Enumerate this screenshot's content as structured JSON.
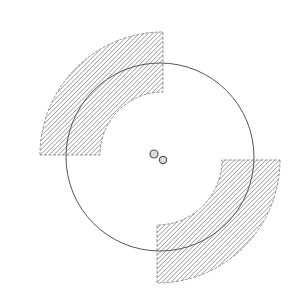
{
  "diagram": {
    "colors": {
      "background": "#ffffff",
      "stroke": "#555555",
      "hatch": "#777777",
      "dash": "#888888"
    },
    "circle": {
      "cx": 160,
      "cy": 157,
      "r": 94
    },
    "sectors": [
      {
        "name": "top-left",
        "cx": 163,
        "cy": 155,
        "inner_r": 63,
        "outer_r": 123,
        "start_deg": 180,
        "end_deg": 270
      },
      {
        "name": "bottom-right",
        "cx": 157,
        "cy": 160,
        "inner_r": 65,
        "outer_r": 123,
        "start_deg": 0,
        "end_deg": 90
      }
    ],
    "center_dots": [
      {
        "cx": 154,
        "cy": 154,
        "r": 4
      },
      {
        "cx": 163,
        "cy": 160,
        "r": 3.6
      }
    ]
  }
}
